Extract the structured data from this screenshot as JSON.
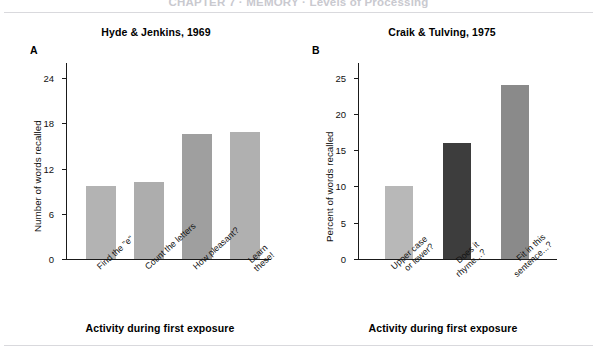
{
  "page": {
    "running_head": "CHAPTER 7 · MEMORY · Levels of Processing"
  },
  "figure": {
    "panels": [
      {
        "letter": "A",
        "title": "Hyde & Jenkins, 1969",
        "xlabel": "Activity during first exposure",
        "ylabel": "Number of words recalled"
      },
      {
        "letter": "B",
        "title": "Craik & Tulving, 1975",
        "xlabel": "Activity during first exposure",
        "ylabel": "Percent of words recalled"
      }
    ]
  },
  "chart_data": [
    {
      "type": "bar",
      "title": "Hyde & Jenkins, 1969",
      "panel": "A",
      "xlabel": "Activity during first exposure",
      "ylabel": "Number of words recalled",
      "categories": [
        "Find the \"e\"",
        "Count the letters",
        "How pleasant?",
        "Learn these!"
      ],
      "category_lines": [
        [
          "Find the \"e\""
        ],
        [
          "Count the letters"
        ],
        [
          "How pleasant?"
        ],
        [
          "Learn these!"
        ]
      ],
      "values": [
        9.7,
        10.2,
        16.6,
        16.8
      ],
      "colors": [
        "#b3b3b3",
        "#adadad",
        "#9f9f9f",
        "#b0b0b0"
      ],
      "ylim": [
        0,
        26
      ],
      "yticks": [
        0,
        6,
        12,
        18,
        24
      ],
      "grid": false,
      "legend": false
    },
    {
      "type": "bar",
      "title": "Craik & Tulving, 1975",
      "panel": "B",
      "xlabel": "Activity during first exposure",
      "ylabel": "Percent of words recalled",
      "categories": [
        "Upper case or lower?",
        "Does it rhyme...?",
        "Fit in this sentence...?"
      ],
      "category_lines": [
        [
          "Upper case",
          "or lower?"
        ],
        [
          "Does it",
          "rhyme...?"
        ],
        [
          "Fit in this",
          "sentence...?"
        ]
      ],
      "values": [
        10,
        16,
        24
      ],
      "colors": [
        "#b8b8b8",
        "#3d3d3d",
        "#8a8a8a"
      ],
      "ylim": [
        0,
        27
      ],
      "yticks": [
        0,
        5,
        10,
        15,
        20,
        25
      ],
      "grid": false,
      "legend": false
    }
  ]
}
